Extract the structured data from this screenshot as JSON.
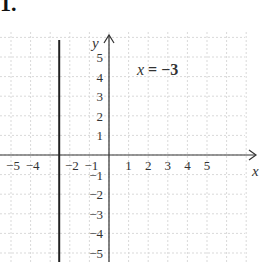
{
  "problem": {
    "number": "1."
  },
  "chart_data": {
    "type": "line",
    "title": "",
    "equation_label": "x = −3",
    "xlabel": "x",
    "ylabel": "y",
    "xlim": [
      -5.5,
      7.5
    ],
    "ylim": [
      -5.5,
      6
    ],
    "grid": true,
    "x_tick_labels": [
      "−5",
      "−4",
      "−2",
      "−1",
      "1",
      "2",
      "3",
      "4",
      "5"
    ],
    "x_ticks": [
      -5,
      -4,
      -2,
      -1,
      1,
      2,
      3,
      4,
      5
    ],
    "y_tick_labels": [
      "5",
      "4",
      "3",
      "2",
      "1",
      "−1",
      "−2",
      "−3",
      "−4",
      "−5"
    ],
    "y_ticks": [
      5,
      4,
      3,
      2,
      1,
      -1,
      -2,
      -3,
      -4,
      -5
    ],
    "series": [
      {
        "name": "x = −3",
        "kind": "vertical-line",
        "x": -3,
        "y_range": [
          -5.5,
          5.8
        ],
        "color": "#222222"
      }
    ],
    "colors": {
      "axis": "#333333",
      "grid": "#d9d9d9",
      "line": "#222222"
    }
  }
}
